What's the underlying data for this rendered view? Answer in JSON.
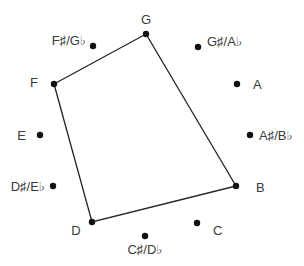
{
  "diagram": {
    "type": "chromatic-circle",
    "notes": [
      {
        "name": "G",
        "dot": [
          146,
          34
        ],
        "label": [
          146,
          24
        ],
        "anchor": "middle"
      },
      {
        "name": "G♯/A♭",
        "dot": [
          198,
          47
        ],
        "label": [
          207,
          46
        ],
        "anchor": "start"
      },
      {
        "name": "A",
        "dot": [
          237,
          84
        ],
        "label": [
          253,
          89
        ],
        "anchor": "start"
      },
      {
        "name": "A♯/B♭",
        "dot": [
          250,
          135
        ],
        "label": [
          259,
          140
        ],
        "anchor": "start"
      },
      {
        "name": "B",
        "dot": [
          236,
          186
        ],
        "label": [
          256,
          192
        ],
        "anchor": "start"
      },
      {
        "name": "C",
        "dot": [
          197,
          223
        ],
        "label": [
          213,
          235
        ],
        "anchor": "start"
      },
      {
        "name": "C♯/D♭",
        "dot": [
          145,
          236
        ],
        "label": [
          145,
          254
        ],
        "anchor": "middle"
      },
      {
        "name": "D",
        "dot": [
          92,
          222
        ],
        "label": [
          76,
          235
        ],
        "anchor": "middle"
      },
      {
        "name": "D♯/E♭",
        "dot": [
          53,
          186
        ],
        "label": [
          45,
          191
        ],
        "anchor": "end"
      },
      {
        "name": "E",
        "dot": [
          40,
          135
        ],
        "label": [
          26,
          140
        ],
        "anchor": "end"
      },
      {
        "name": "F",
        "dot": [
          54,
          84
        ],
        "label": [
          38,
          87
        ],
        "anchor": "end"
      },
      {
        "name": "F♯/G♭",
        "dot": [
          93,
          46
        ],
        "label": [
          86,
          45
        ],
        "anchor": "end"
      }
    ],
    "polygon": [
      "G",
      "B",
      "D",
      "F"
    ],
    "colors": {
      "dot": "#111111",
      "line": "#222222",
      "label": "#3a3a3a",
      "background": "#ffffff"
    }
  }
}
